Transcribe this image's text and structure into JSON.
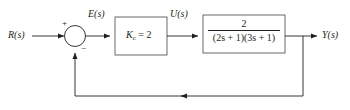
{
  "diagram": {
    "type": "control-block-diagram",
    "colors": {
      "line": "#231f20",
      "background": "#ffffff",
      "block_border": "#58595b"
    },
    "signals": {
      "input": "R(s)",
      "error": "E(s)",
      "control": "U(s)",
      "output": "Y(s)"
    },
    "summing_junction": {
      "plus_sign": "+",
      "minus_sign": "−"
    },
    "blocks": [
      {
        "name": "controller",
        "label_variable": "K",
        "label_subscript": "c",
        "label_equals": " = 2",
        "full_label": "Kc = 2"
      },
      {
        "name": "process",
        "numerator": "2",
        "denominator_part1": "(2s + 1)",
        "denominator_part2": "(3s + 1)",
        "full_label": "2/((2s + 1)(3s + 1))"
      }
    ]
  }
}
